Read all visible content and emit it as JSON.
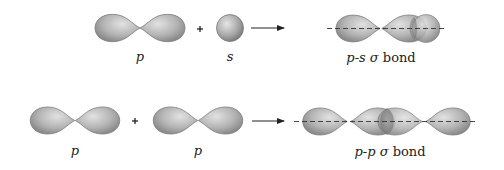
{
  "diagram": {
    "colors": {
      "orbital_fill_light": "#d4d4d4",
      "orbital_fill_dark": "#8a8a8a",
      "orbital_stroke": "#7a7a7a",
      "arrow": "#222222",
      "axis_dash": "#333333",
      "background": "#ffffff"
    },
    "rows": [
      {
        "id": "p-s",
        "reactants": [
          {
            "orbital": "p",
            "label": "p"
          },
          {
            "orbital": "s",
            "label": "s"
          }
        ],
        "operator": "+",
        "arrow": "right-arrow",
        "product": {
          "label_prefix": "p-s",
          "label_sigma": "σ",
          "label_suffix": "bond"
        }
      },
      {
        "id": "p-p",
        "reactants": [
          {
            "orbital": "p",
            "label": "p"
          },
          {
            "orbital": "p",
            "label": "p"
          }
        ],
        "operator": "+",
        "arrow": "right-arrow",
        "product": {
          "label_prefix": "p-p",
          "label_sigma": "σ",
          "label_suffix": "bond"
        }
      }
    ]
  }
}
